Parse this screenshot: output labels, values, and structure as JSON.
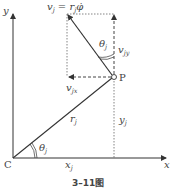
{
  "figure": {
    "caption": "3–11图",
    "axes": {
      "x_label": "x",
      "y_label": "y",
      "origin_label": "C"
    },
    "point_label": "P",
    "labels": {
      "velocity": "v",
      "velocity_sub": "j",
      "velocity_eq": " = r",
      "velocity_eq_sub": "j",
      "phi_dot": "φ̇",
      "vjy": "v",
      "vjy_sub": "jy",
      "vjx": "v",
      "vjx_sub": "jx",
      "rj": "r",
      "rj_sub": "j",
      "yj": "y",
      "yj_sub": "j",
      "xj": "x",
      "xj_sub": "j",
      "theta_top": "θ",
      "theta_top_sub": "j",
      "theta_bottom": "θ",
      "theta_bottom_sub": "j"
    },
    "colors": {
      "line": "#333333",
      "dashed": "#555555",
      "text": "#444444"
    }
  }
}
